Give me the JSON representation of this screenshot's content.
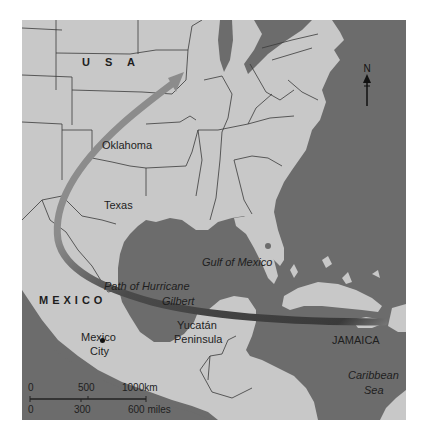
{
  "map": {
    "title": "Path of Hurricane Gilbert",
    "colors": {
      "land": "#c8c8c8",
      "water": "#6c6c6c",
      "border": "#3a3a3a",
      "path": "#4a4a4a",
      "text": "#1e1e1e"
    },
    "labels": {
      "usa": "U S A",
      "mexico": "MEXICO",
      "oklahoma": "Oklahoma",
      "texas": "Texas",
      "gulf": "Gulf of Mexico",
      "path_line1": "Path of Hurricane",
      "path_line2": "Gilbert",
      "yucatan_line1": "Yucatán",
      "yucatan_line2": "Peninsula",
      "mexico_city_line1": "Mexico",
      "mexico_city_line2": "City",
      "jamaica": "JAMAICA",
      "caribbean_line1": "Caribbean",
      "caribbean_line2": "Sea"
    },
    "north_arrow": {
      "label": "N"
    },
    "scale_bar": {
      "km_ticks": [
        "0",
        "500",
        "1000km"
      ],
      "mile_ticks": [
        "0",
        "300",
        "600 miles"
      ]
    },
    "hurricane_path": {
      "start": "Jamaica",
      "via": [
        "Yucatán Peninsula",
        "Gulf of Mexico",
        "Mexico",
        "Texas",
        "Oklahoma"
      ],
      "direction": "west then north"
    }
  }
}
